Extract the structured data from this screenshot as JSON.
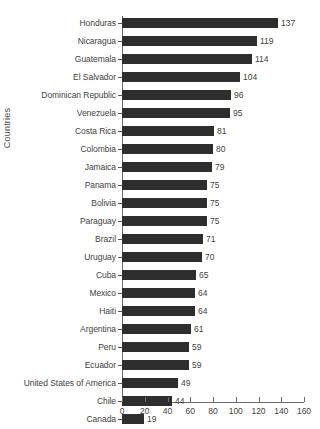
{
  "chart_data": {
    "type": "bar",
    "orientation": "horizontal",
    "title": "",
    "subtitle": "",
    "xlabel": "",
    "ylabel": "Countries",
    "xlim": [
      0,
      160
    ],
    "xticks": [
      0,
      20,
      40,
      60,
      80,
      100,
      120,
      140,
      160
    ],
    "grid": false,
    "legend": false,
    "bar_color": "#2e2e2e",
    "text_color": "#3f3f3f",
    "axis_color": "#6b6b6b",
    "background": "#ffffff",
    "categories": [
      "Honduras",
      "Nicaragua",
      "Guatemala",
      "El Salvador",
      "Dominican Republic",
      "Venezuela",
      "Costa Rica",
      "Colombia",
      "Jamaica",
      "Panama",
      "Bolivia",
      "Paraguay",
      "Brazil",
      "Uruguay",
      "Cuba",
      "Mexico",
      "Haiti",
      "Argentina",
      "Peru",
      "Ecuador",
      "United States of America",
      "Chile",
      "Canada"
    ],
    "values": [
      137,
      119,
      114,
      104,
      96,
      95,
      81,
      80,
      79,
      75,
      75,
      75,
      71,
      70,
      65,
      64,
      64,
      61,
      59,
      59,
      49,
      44,
      19
    ],
    "value_labels": [
      "137",
      "119",
      "114",
      "104",
      "96",
      "95",
      "81",
      "80",
      "79",
      "75",
      "75",
      "75",
      "71",
      "70",
      "65",
      "64",
      "64",
      "61",
      "59",
      "59",
      "49",
      "44",
      "19"
    ]
  }
}
